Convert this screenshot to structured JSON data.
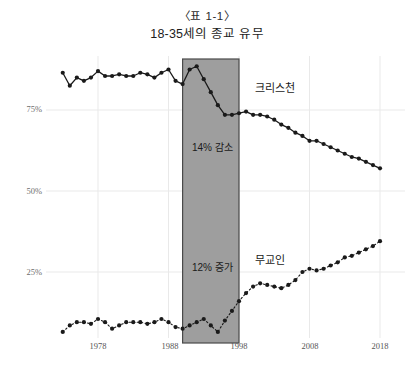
{
  "title": {
    "line1": "〈표 1-1〉",
    "line2": "18-35세의 종교 유무"
  },
  "labels": {
    "christian": "크리스천",
    "nonreligious": "무교인"
  },
  "annotations": {
    "decrease": "14% 감소",
    "increase": "12% 증가"
  },
  "axis": {
    "y_ticks": [
      "75%",
      "50%",
      "25%"
    ],
    "x_ticks": [
      "1978",
      "1988",
      "1998",
      "2008",
      "2018"
    ]
  },
  "colors": {
    "band": "#9e9e9e",
    "band_border": "#4a4a4a",
    "line": "#1a1a1a",
    "grid": "#e9e9e9",
    "tick_text": "#6e6e6e"
  },
  "chart_data": {
    "type": "line",
    "title": "18-35세의 종교 유무",
    "subtitle": "〈표 1-1〉",
    "xlabel": "",
    "ylabel": "",
    "ylim": [
      0,
      100
    ],
    "xlim": [
      1972,
      2019
    ],
    "grid": true,
    "legend": "inline-annotation",
    "y_tick_values": [
      25,
      50,
      75
    ],
    "x_tick_values": [
      1978,
      1988,
      1998,
      2008,
      2018
    ],
    "highlight_band": {
      "x_start": 1990,
      "x_end": 1998,
      "label_top": "14% 감소",
      "label_bottom": "12% 증가",
      "fill": "#9e9e9e"
    },
    "series": [
      {
        "name": "크리스천",
        "style": "solid",
        "x": [
          1973,
          1974,
          1975,
          1976,
          1977,
          1978,
          1979,
          1980,
          1981,
          1982,
          1983,
          1984,
          1985,
          1986,
          1987,
          1988,
          1989,
          1990,
          1991,
          1992,
          1993,
          1994,
          1995,
          1996,
          1997,
          1998,
          1999,
          2000,
          2001,
          2002,
          2003,
          2004,
          2005,
          2006,
          2007,
          2008,
          2009,
          2010,
          2011,
          2012,
          2013,
          2014,
          2015,
          2016,
          2017,
          2018
        ],
        "values": [
          86.5,
          82.5,
          85.0,
          84.0,
          85.0,
          87.0,
          85.5,
          85.5,
          86.0,
          85.5,
          85.5,
          86.5,
          86.0,
          85.0,
          86.5,
          87.5,
          84.0,
          83.0,
          87.5,
          88.5,
          84.5,
          80.5,
          76.5,
          73.5,
          73.5,
          74.0,
          74.5,
          73.5,
          73.5,
          73.0,
          72.0,
          70.5,
          69.5,
          68.0,
          67.0,
          65.5,
          65.5,
          64.5,
          63.5,
          62.5,
          61.5,
          60.5,
          60.0,
          59.0,
          58.0,
          57.0
        ]
      },
      {
        "name": "무교인",
        "style": "dotted",
        "x": [
          1973,
          1974,
          1975,
          1976,
          1977,
          1978,
          1979,
          1980,
          1981,
          1982,
          1983,
          1984,
          1985,
          1986,
          1987,
          1988,
          1989,
          1990,
          1991,
          1992,
          1993,
          1994,
          1995,
          1996,
          1997,
          1998,
          1999,
          2000,
          2001,
          2002,
          2003,
          2004,
          2005,
          2006,
          2007,
          2008,
          2009,
          2010,
          2011,
          2012,
          2013,
          2014,
          2015,
          2016,
          2017,
          2018
        ],
        "values": [
          6.5,
          8.5,
          9.5,
          9.5,
          9.0,
          10.5,
          9.5,
          7.5,
          8.5,
          9.5,
          9.5,
          9.5,
          9.0,
          9.5,
          10.5,
          9.5,
          8.0,
          7.5,
          8.5,
          9.5,
          10.5,
          8.5,
          6.5,
          10.0,
          13.0,
          16.0,
          18.5,
          20.5,
          21.5,
          21.0,
          20.5,
          20.0,
          21.0,
          22.5,
          25.0,
          26.0,
          25.5,
          26.0,
          27.0,
          28.0,
          29.5,
          30.0,
          31.0,
          32.0,
          33.0,
          34.5
        ]
      }
    ]
  }
}
